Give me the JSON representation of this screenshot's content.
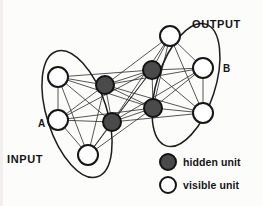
{
  "figure": {
    "groups": [
      {
        "id": "A",
        "tag": "A",
        "name": "INPUT",
        "tag_x": 38,
        "tag_y": 127,
        "name_x": 7,
        "name_y": 163,
        "ellipse": {
          "cx": 77,
          "cy": 114,
          "rx": 30,
          "ry": 66,
          "rotate": -18
        }
      },
      {
        "id": "B",
        "tag": "B",
        "name": "OUTPUT",
        "tag_x": 223,
        "tag_y": 72,
        "name_x": 192,
        "name_y": 28,
        "ellipse": {
          "cx": 186,
          "cy": 85,
          "rx": 29,
          "ry": 64,
          "rotate": 18
        }
      }
    ],
    "nodes": [
      {
        "id": "a1",
        "kind": "visible",
        "group": "A",
        "x": 58,
        "y": 77,
        "r": 10
      },
      {
        "id": "a2",
        "kind": "visible",
        "group": "A",
        "x": 58,
        "y": 120,
        "r": 10
      },
      {
        "id": "a3",
        "kind": "visible",
        "group": "A",
        "x": 88,
        "y": 155,
        "r": 10
      },
      {
        "id": "b1",
        "kind": "visible",
        "group": "B",
        "x": 170,
        "y": 36,
        "r": 10
      },
      {
        "id": "b2",
        "kind": "visible",
        "group": "B",
        "x": 203,
        "y": 68,
        "r": 10
      },
      {
        "id": "b3",
        "kind": "visible",
        "group": "B",
        "x": 203,
        "y": 113,
        "r": 10
      },
      {
        "id": "h1",
        "kind": "hidden",
        "group": "H",
        "x": 105,
        "y": 85,
        "r": 9
      },
      {
        "id": "h2",
        "kind": "hidden",
        "group": "H",
        "x": 152,
        "y": 70,
        "r": 9
      },
      {
        "id": "h3",
        "kind": "hidden",
        "group": "H",
        "x": 112,
        "y": 122,
        "r": 9
      },
      {
        "id": "h4",
        "kind": "hidden",
        "group": "H",
        "x": 153,
        "y": 108,
        "r": 9
      }
    ],
    "edges": [
      [
        "a1",
        "a2"
      ],
      [
        "a1",
        "a3"
      ],
      [
        "a2",
        "a3"
      ],
      [
        "b1",
        "b2"
      ],
      [
        "b1",
        "b3"
      ],
      [
        "b2",
        "b3"
      ],
      [
        "h1",
        "h2"
      ],
      [
        "h1",
        "h3"
      ],
      [
        "h1",
        "h4"
      ],
      [
        "h2",
        "h3"
      ],
      [
        "h2",
        "h4"
      ],
      [
        "h3",
        "h4"
      ],
      [
        "a1",
        "h1"
      ],
      [
        "a1",
        "h2"
      ],
      [
        "a1",
        "h3"
      ],
      [
        "a1",
        "h4"
      ],
      [
        "a2",
        "h1"
      ],
      [
        "a2",
        "h2"
      ],
      [
        "a2",
        "h3"
      ],
      [
        "a2",
        "h4"
      ],
      [
        "a3",
        "h1"
      ],
      [
        "a3",
        "h2"
      ],
      [
        "a3",
        "h3"
      ],
      [
        "a3",
        "h4"
      ],
      [
        "b1",
        "h1"
      ],
      [
        "b1",
        "h2"
      ],
      [
        "b1",
        "h3"
      ],
      [
        "b1",
        "h4"
      ],
      [
        "b2",
        "h1"
      ],
      [
        "b2",
        "h2"
      ],
      [
        "b2",
        "h3"
      ],
      [
        "b2",
        "h4"
      ],
      [
        "b3",
        "h1"
      ],
      [
        "b3",
        "h2"
      ],
      [
        "b3",
        "h3"
      ],
      [
        "b3",
        "h4"
      ]
    ],
    "legend": {
      "items": [
        {
          "id": "hidden",
          "kind": "hidden",
          "label": "hidden unit",
          "cx": 168,
          "cy": 162,
          "r": 8,
          "text_x": 183,
          "text_y": 166
        },
        {
          "id": "visible",
          "kind": "visible",
          "label": "visible unit",
          "cx": 168,
          "cy": 185,
          "r": 8,
          "text_x": 183,
          "text_y": 189
        }
      ]
    },
    "colors": {
      "hidden_fill": "#4a4a4a",
      "visible_fill": "#ffffff",
      "stroke": "#151515",
      "edge": "#2b2b2b",
      "background": "#fcfcfb"
    }
  }
}
